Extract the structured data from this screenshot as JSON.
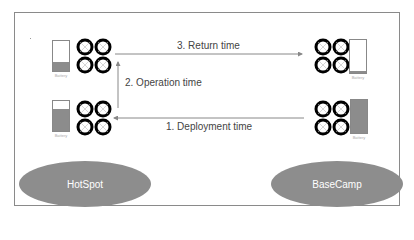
{
  "diagram": {
    "arrows": {
      "return": "3. Return time",
      "operation": "2. Operation time",
      "deployment": "1. Deployment time"
    },
    "battery_label": "Battery",
    "batteries": {
      "hotspot_top": {
        "fill_percent": 30
      },
      "hotspot_bottom": {
        "fill_percent": 75
      },
      "basecamp_top": {
        "fill_percent": 5
      },
      "basecamp_bottom": {
        "fill_percent": 100
      }
    },
    "locations": {
      "left": "HotSpot",
      "right": "BaseCamp"
    },
    "colors": {
      "fill": "#8c8c8c",
      "ellipse": "#8d8d8d",
      "line": "#888888"
    }
  }
}
